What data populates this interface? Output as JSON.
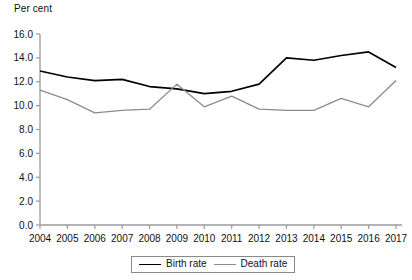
{
  "chart_data": {
    "type": "line",
    "title": "",
    "subtitle": "",
    "xlabel": "",
    "ylabel": "Per cent",
    "categories": [
      "2004",
      "2005",
      "2006",
      "2007",
      "2008",
      "2009",
      "2010",
      "2011",
      "2012",
      "2013",
      "2014",
      "2015",
      "2016",
      "2017"
    ],
    "x": [
      2004,
      2005,
      2006,
      2007,
      2008,
      2009,
      2010,
      2011,
      2012,
      2013,
      2014,
      2015,
      2016,
      2017
    ],
    "ylim": [
      0.0,
      16.0
    ],
    "ytick_step": 2.0,
    "ytick_labels": [
      "0.0",
      "2.0",
      "4.0",
      "6.0",
      "8.0",
      "10.0",
      "12.0",
      "14.0",
      "16.0"
    ],
    "ytick_values": [
      0.0,
      2.0,
      4.0,
      6.0,
      8.0,
      10.0,
      12.0,
      14.0,
      16.0
    ],
    "grid": false,
    "legend_position": "bottom-center",
    "series": [
      {
        "name": "Birth rate",
        "color": "#000000",
        "values": [
          12.9,
          12.4,
          12.1,
          12.2,
          11.6,
          11.4,
          11.0,
          11.2,
          11.8,
          14.0,
          13.8,
          14.2,
          14.5,
          13.2
        ]
      },
      {
        "name": "Death rate",
        "color": "#8c8c8c",
        "values": [
          11.3,
          10.5,
          9.4,
          9.6,
          9.7,
          11.8,
          9.9,
          10.8,
          9.7,
          9.6,
          9.6,
          10.6,
          9.9,
          12.1
        ]
      }
    ]
  },
  "axis": {
    "unit_label": "Per cent",
    "axis_color": "#9a9a9a"
  },
  "legend": {
    "items": [
      {
        "label": "Birth rate",
        "color": "#000000"
      },
      {
        "label": "Death rate",
        "color": "#8c8c8c"
      }
    ]
  }
}
